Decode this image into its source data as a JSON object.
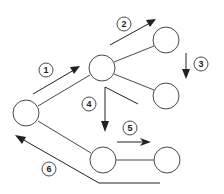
{
  "diagram": {
    "type": "tree-traversal",
    "nodes": [
      {
        "id": "root",
        "cx": 26,
        "cy": 113,
        "r": 13
      },
      {
        "id": "a",
        "cx": 102,
        "cy": 68,
        "r": 13
      },
      {
        "id": "b",
        "cx": 166,
        "cy": 40,
        "r": 13
      },
      {
        "id": "c",
        "cx": 166,
        "cy": 96,
        "r": 13
      },
      {
        "id": "d",
        "cx": 103,
        "cy": 160,
        "r": 13
      },
      {
        "id": "e",
        "cx": 167,
        "cy": 160,
        "r": 13
      }
    ],
    "steps": [
      {
        "label": "1",
        "cx": 46,
        "cy": 70
      },
      {
        "label": "2",
        "cx": 124,
        "cy": 24
      },
      {
        "label": "3",
        "cx": 201,
        "cy": 64
      },
      {
        "label": "4",
        "cx": 89,
        "cy": 104
      },
      {
        "label": "5",
        "cx": 130,
        "cy": 128
      },
      {
        "label": "6",
        "cx": 49,
        "cy": 169
      }
    ]
  }
}
